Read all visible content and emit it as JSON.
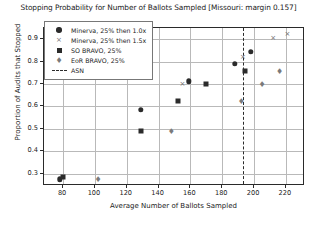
{
  "chart_data": {
    "type": "scatter",
    "title": "Stopping Probability for Number of Ballots Sampled [Missouri: margin 0.157]",
    "xlabel": "Average Number of Ballots Sampled",
    "ylabel": "Proportion of Audits that Stopped",
    "xlim": [
      68,
      232
    ],
    "ylim": [
      0.245,
      0.95
    ],
    "xticks": [
      80,
      100,
      120,
      140,
      160,
      180,
      200,
      220
    ],
    "yticks": [
      0.3,
      0.4,
      0.5,
      0.6,
      0.7,
      0.8,
      0.9
    ],
    "xtick_labels": [
      "80",
      "100",
      "120",
      "140",
      "160",
      "180",
      "200",
      "220"
    ],
    "ytick_labels": [
      "0.3",
      "0.4",
      "0.5",
      "0.6",
      "0.7",
      "0.8",
      "0.9"
    ],
    "grid": true,
    "legend_position": "upper left",
    "annotations": [
      {
        "name": "ASN",
        "type": "vline",
        "x": 193,
        "style": "dashed",
        "color": "#2b2b2b"
      }
    ],
    "series": [
      {
        "name": "Minerva, 25% then 1.0x",
        "marker": "circle-filled",
        "color": "#2b2b2b",
        "points": [
          {
            "x": 78,
            "y": 0.275
          },
          {
            "x": 129,
            "y": 0.585
          },
          {
            "x": 159,
            "y": 0.712
          },
          {
            "x": 188,
            "y": 0.79
          },
          {
            "x": 198,
            "y": 0.845
          }
        ]
      },
      {
        "name": "Minerva, 25% then 1.5x",
        "marker": "x",
        "color": "#6e6e6e",
        "points": [
          {
            "x": 155,
            "y": 0.7
          },
          {
            "x": 193,
            "y": 0.82
          },
          {
            "x": 212,
            "y": 0.905
          },
          {
            "x": 221,
            "y": 0.925
          }
        ]
      },
      {
        "name": "SO BRAVO, 25%",
        "marker": "square-filled",
        "color": "#2b2b2b",
        "points": [
          {
            "x": 80,
            "y": 0.285
          },
          {
            "x": 129,
            "y": 0.49
          },
          {
            "x": 152,
            "y": 0.625
          },
          {
            "x": 170,
            "y": 0.702
          },
          {
            "x": 194,
            "y": 0.758
          }
        ]
      },
      {
        "name": "EoR BRAVO, 25%",
        "marker": "thin-diamond",
        "color": "#7a7a7a",
        "points": [
          {
            "x": 102,
            "y": 0.278
          },
          {
            "x": 148,
            "y": 0.49
          },
          {
            "x": 192,
            "y": 0.625
          },
          {
            "x": 205,
            "y": 0.7
          },
          {
            "x": 216,
            "y": 0.757
          }
        ]
      }
    ],
    "legend_entries": [
      {
        "label": "Minerva, 25% then 1.0x",
        "marker": "circle-filled"
      },
      {
        "label": "Minerva, 25% then 1.5x",
        "marker": "x"
      },
      {
        "label": "SO BRAVO, 25%",
        "marker": "square-filled"
      },
      {
        "label": "EoR BRAVO, 25%",
        "marker": "thin-diamond"
      },
      {
        "label": "ASN",
        "marker": "dashed-line"
      }
    ]
  }
}
